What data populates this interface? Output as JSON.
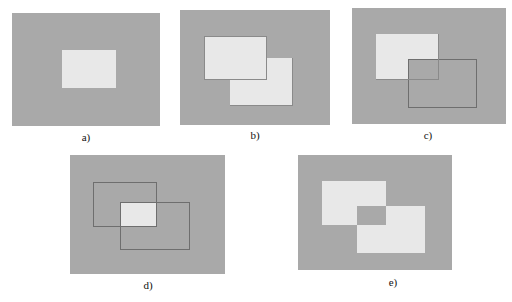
{
  "figure": {
    "colors": {
      "background": "#a9a9a9",
      "region": "#e8e8e8",
      "outline": "#6e6e6e"
    },
    "panels": [
      {
        "id": "a",
        "label": "a)"
      },
      {
        "id": "b",
        "label": "b)"
      },
      {
        "id": "c",
        "label": "c)"
      },
      {
        "id": "d",
        "label": "d)"
      },
      {
        "id": "e",
        "label": "e)"
      }
    ]
  }
}
